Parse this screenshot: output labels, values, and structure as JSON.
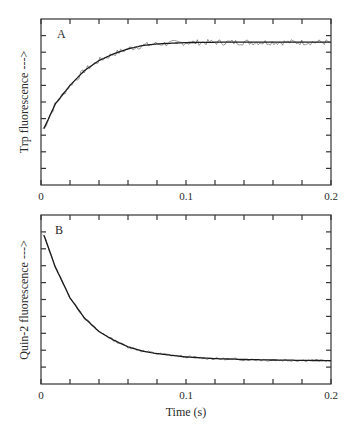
{
  "chart_data": [
    {
      "type": "line",
      "panel_label": "A",
      "title": "",
      "xlabel": "",
      "ylabel": "Trp fluorescence --->",
      "xlim": [
        0,
        0.2
      ],
      "x_ticks": [
        "0",
        "0.1",
        "0.2"
      ],
      "x_minor_step": 0.02,
      "y_ticks_count": 10,
      "y_tick_labels": [],
      "grid": false,
      "legend": null,
      "description": "Exponential rise of Trp fluorescence to a plateau; noisy data points with smooth single-exponential fit",
      "series": [
        {
          "name": "fit",
          "x": [
            0.002,
            0.01,
            0.02,
            0.03,
            0.04,
            0.05,
            0.06,
            0.07,
            0.08,
            0.1,
            0.12,
            0.14,
            0.16,
            0.18,
            0.2
          ],
          "y": [
            3.4,
            4.9,
            6.0,
            6.9,
            7.5,
            7.9,
            8.2,
            8.4,
            8.5,
            8.58,
            8.6,
            8.6,
            8.6,
            8.6,
            8.6
          ]
        }
      ],
      "y_units": "relative (tick divisions, 0-10)"
    },
    {
      "type": "line",
      "panel_label": "B",
      "title": "",
      "xlabel": "Time (s)",
      "ylabel": "Quin-2 fluorescence --->",
      "xlim": [
        0,
        0.2
      ],
      "x_ticks": [
        "0",
        "0.1",
        "0.2"
      ],
      "x_minor_step": 0.02,
      "y_ticks_count": 10,
      "y_tick_labels": [],
      "grid": false,
      "legend": null,
      "description": "Exponential decay of Quin-2 fluorescence to a plateau; noisy data with smooth fit",
      "series": [
        {
          "name": "fit",
          "x": [
            0.002,
            0.01,
            0.02,
            0.03,
            0.04,
            0.05,
            0.06,
            0.07,
            0.08,
            0.1,
            0.12,
            0.14,
            0.16,
            0.18,
            0.2
          ],
          "y": [
            8.8,
            6.9,
            5.1,
            3.9,
            3.1,
            2.6,
            2.2,
            1.95,
            1.8,
            1.6,
            1.5,
            1.45,
            1.42,
            1.4,
            1.38
          ]
        }
      ],
      "y_units": "relative (tick divisions, 0-10)"
    }
  ],
  "panels": {
    "a": {
      "label": "A",
      "ylabel": "Trp fluorescence --->",
      "x_tick_0": "0",
      "x_tick_1": "0.1",
      "x_tick_2": "0.2"
    },
    "b": {
      "label": "B",
      "ylabel": "Quin-2 fluorescence --->",
      "x_tick_0": "0",
      "x_tick_1": "0.1",
      "x_tick_2": "0.2",
      "xlabel": "Time (s)"
    }
  },
  "colors": {
    "line": "#1a1a1a",
    "frame": "#333333",
    "background": "#ffffff"
  }
}
